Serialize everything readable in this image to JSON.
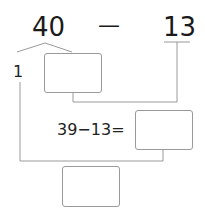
{
  "problem": {
    "minuend": "40",
    "operator": "—",
    "subtrahend": "13",
    "split_part": "1",
    "equation": "39−13=",
    "answer_boxes": [
      "",
      "",
      ""
    ]
  },
  "colors": {
    "text": "#1a1a1a",
    "line": "#9a9a9a",
    "box_border": "#9a9a9a"
  }
}
